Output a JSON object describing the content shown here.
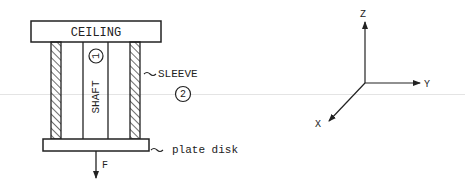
{
  "diagram": {
    "components": {
      "ceiling": {
        "label": "CEILING"
      },
      "shaft": {
        "label": "SHAFT",
        "number": "1"
      },
      "sleeve": {
        "label": "SLEEVE",
        "number": "2"
      },
      "plate": {
        "label": "plate disk"
      },
      "force": {
        "label": "F"
      }
    },
    "axes": {
      "z_label": "Z",
      "y_label": "Y",
      "x_label": "X"
    },
    "colors": {
      "line": "#222222",
      "background": "#ffffff"
    }
  }
}
